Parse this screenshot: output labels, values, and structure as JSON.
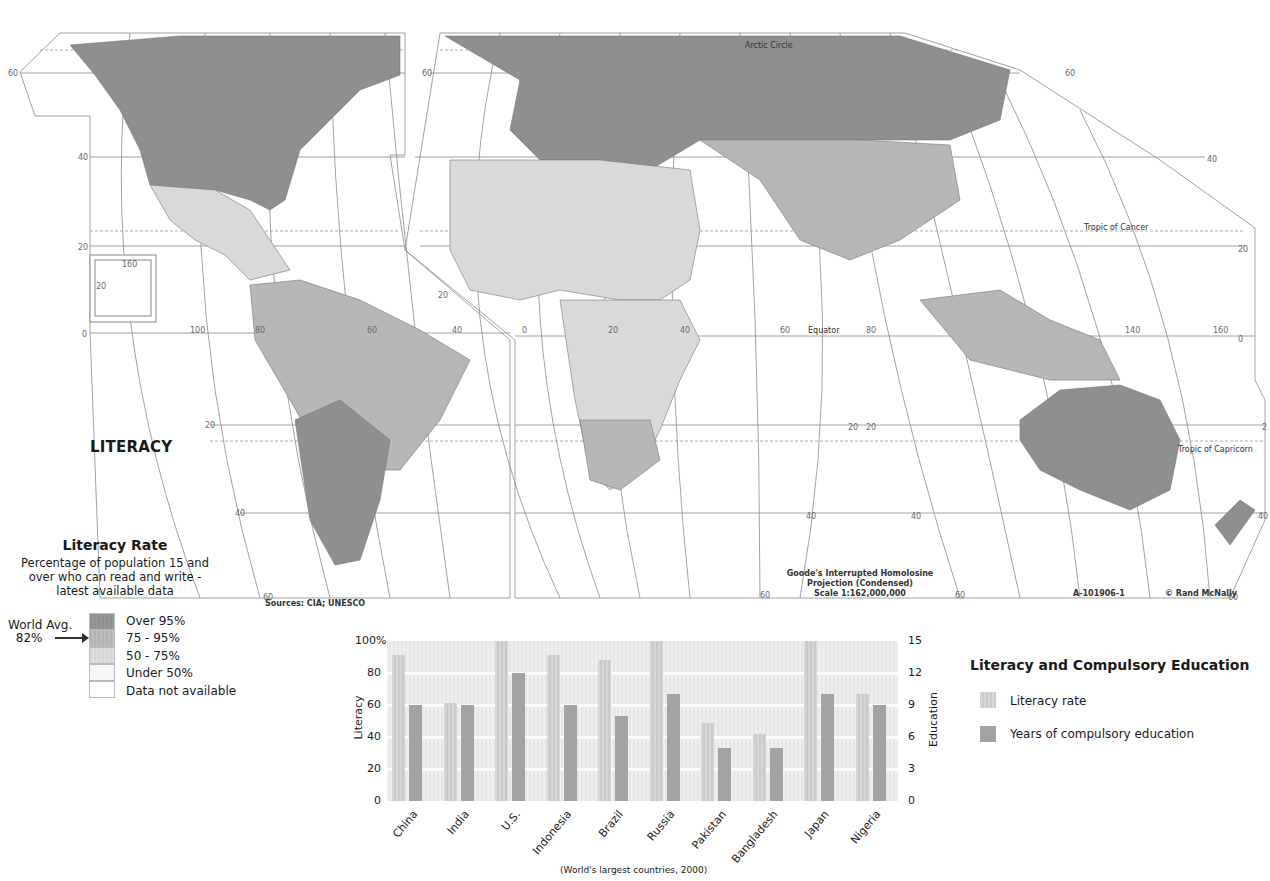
{
  "map": {
    "title": "LITERACY",
    "projection": [
      "Goode's Interrupted Homolosine",
      "Projection (Condensed)",
      "Scale 1:162,000,000"
    ],
    "source": "Sources: CIA; UNESCO",
    "map_id": "A-101906-1",
    "copyright": "© Rand McNally",
    "labels": {
      "arctic_circle": "Arctic Circle",
      "tropic_cancer": "Tropic of Cancer",
      "tropic_capricorn": "Tropic of Capricorn",
      "equator": "Equator"
    },
    "colors": {
      "over_95": "#8f8f8f",
      "75_95": "#b7b7b7",
      "50_75": "#d9d9d9",
      "under_50": "#f5f5f5",
      "na": "#ffffff",
      "ocean": "#ffffff",
      "grid": "#8a8a8a"
    }
  },
  "legend": {
    "title": "Literacy Rate",
    "subtitle": [
      "Percentage of population 15 and",
      "over who can read and write -",
      "latest available data"
    ],
    "world_avg_label": "World Avg.",
    "world_avg_value": "82%",
    "items": [
      {
        "label": "Over 95%",
        "color": "#8f8f8f"
      },
      {
        "label": "75 - 95%",
        "color": "#b5b5b5"
      },
      {
        "label": "50 - 75%",
        "color": "#d8d8d8"
      },
      {
        "label": "Under 50%",
        "color": "#f6f6f6"
      },
      {
        "label": "Data not available",
        "color": "#ffffff"
      }
    ]
  },
  "chart_legend": {
    "title": "Literacy and Compulsory Education",
    "items": [
      {
        "label": "Literacy rate",
        "color": "#d2d2d2"
      },
      {
        "label": "Years of compulsory education",
        "color": "#a3a3a3"
      }
    ]
  },
  "chart_data": {
    "type": "bar",
    "title": "Literacy and Compulsory Education",
    "caption": "(World's largest countries, 2000)",
    "categories": [
      "China",
      "India",
      "U.S.",
      "Indonesia",
      "Brazil",
      "Russia",
      "Pakistan",
      "Bangladesh",
      "Japan",
      "Nigeria"
    ],
    "series": [
      {
        "name": "Literacy rate",
        "axis": "left",
        "values": [
          91,
          61,
          100,
          91,
          88,
          100,
          49,
          42,
          100,
          67
        ]
      },
      {
        "name": "Years of compulsory education",
        "axis": "right",
        "values": [
          9,
          9,
          12,
          9,
          8,
          10,
          5,
          5,
          10,
          9
        ]
      }
    ],
    "ylabel_left": "Literacy",
    "ylabel_right": "Education",
    "yticks_left": [
      "100%",
      "80",
      "60",
      "40",
      "20",
      "0"
    ],
    "yticks_right": [
      "15",
      "12",
      "9",
      "6",
      "3",
      "0"
    ],
    "ylim_left": [
      0,
      100
    ],
    "ylim_right": [
      0,
      15
    ],
    "grid": true
  }
}
